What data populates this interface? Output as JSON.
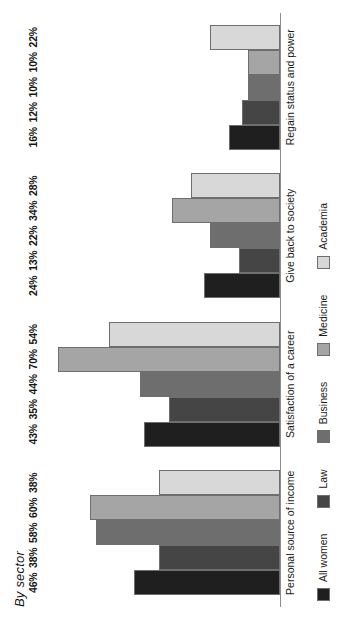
{
  "chart_data": {
    "type": "bar",
    "title": "By sector",
    "xlabel": "",
    "ylabel": "",
    "ylim": [
      0,
      75
    ],
    "grid": false,
    "orientation": "rotated-90-ccw",
    "legend_position": "bottom-left",
    "categories": [
      "Personal source of income",
      "Satisfaction of a career",
      "Give back to society",
      "Regain status and power"
    ],
    "series": [
      {
        "name": "All women",
        "color": "#1f1f1f",
        "values": [
          46,
          43,
          24,
          16
        ],
        "labels": [
          "46%",
          "43%",
          "24%",
          "16%"
        ]
      },
      {
        "name": "Law",
        "color": "#454545",
        "values": [
          38,
          35,
          13,
          12
        ],
        "labels": [
          "38%",
          "35%",
          "13%",
          "12%"
        ]
      },
      {
        "name": "Business",
        "color": "#6e6e6e",
        "values": [
          58,
          44,
          22,
          10
        ],
        "labels": [
          "58%",
          "44%",
          "22%",
          "10%"
        ]
      },
      {
        "name": "Medicine",
        "color": "#a5a5a5",
        "values": [
          60,
          70,
          34,
          10
        ],
        "labels": [
          "60%",
          "70%",
          "34%",
          "10%"
        ]
      },
      {
        "name": "Academia",
        "color": "#d8d8d8",
        "values": [
          38,
          54,
          28,
          22
        ],
        "labels": [
          "38%",
          "54%",
          "28%",
          "22%"
        ]
      }
    ]
  }
}
